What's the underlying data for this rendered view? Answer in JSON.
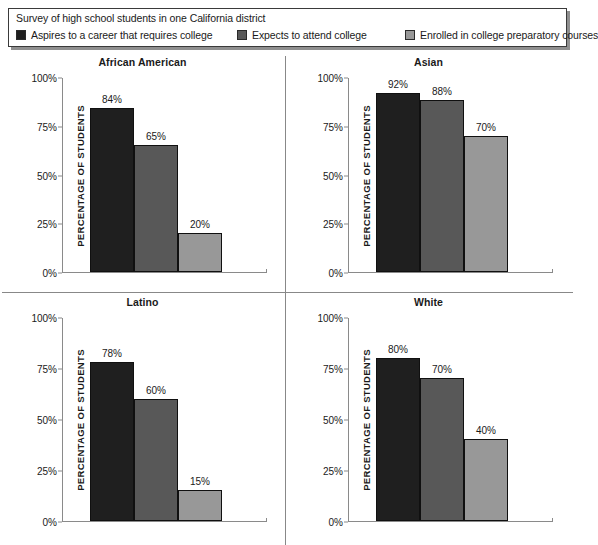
{
  "legend": {
    "caption": "Survey of high school students in one California district",
    "items": [
      {
        "label": "Aspires to a career that requires college",
        "color": "#1f1f1f",
        "icon": "legend-swatch-dark"
      },
      {
        "label": "Expects to attend college",
        "color": "#585858",
        "icon": "legend-swatch-medium"
      },
      {
        "label": "Enrolled in college preparatory courses",
        "color": "#989898",
        "icon": "legend-swatch-light"
      }
    ]
  },
  "axis": {
    "ylabel": "PERCENTAGE OF STUDENTS",
    "yticks": [
      "0%",
      "25%",
      "50%",
      "75%",
      "100%"
    ]
  },
  "chart_data": {
    "type": "bar",
    "title": "Survey of high school students in one California district",
    "xlabel": "",
    "ylabel": "PERCENTAGE OF STUDENTS",
    "ylim": [
      0,
      100
    ],
    "ytick_values": [
      0,
      25,
      50,
      75,
      100
    ],
    "ytick_labels": [
      "0%",
      "25%",
      "50%",
      "75%",
      "100%"
    ],
    "grid": false,
    "legend_position": "top",
    "layout": "2x2 small multiples",
    "categories": [
      "African American",
      "Asian",
      "Latino",
      "White"
    ],
    "series": [
      {
        "name": "Aspires to a career that requires college",
        "color": "#1f1f1f",
        "values": [
          84,
          92,
          78,
          80
        ],
        "labels": [
          "84%",
          "92%",
          "78%",
          "80%"
        ]
      },
      {
        "name": "Expects to attend college",
        "color": "#585858",
        "values": [
          65,
          88,
          60,
          70
        ],
        "labels": [
          "65%",
          "88%",
          "60%",
          "70%"
        ]
      },
      {
        "name": "Enrolled in college preparatory courses",
        "color": "#989898",
        "values": [
          70,
          70,
          15,
          40
        ],
        "labels": [
          "20%",
          "70%",
          "15%",
          "40%"
        ]
      }
    ],
    "panels": [
      {
        "title": "African American",
        "bars": [
          {
            "series": "Aspires to a career that requires college",
            "value": 84,
            "label": "84%",
            "color": "#1f1f1f"
          },
          {
            "series": "Expects to attend college",
            "value": 65,
            "label": "65%",
            "color": "#585858"
          },
          {
            "series": "Enrolled in college preparatory courses",
            "value": 20,
            "label": "20%",
            "color": "#989898"
          }
        ]
      },
      {
        "title": "Asian",
        "bars": [
          {
            "series": "Aspires to a career that requires college",
            "value": 92,
            "label": "92%",
            "color": "#1f1f1f"
          },
          {
            "series": "Expects to attend college",
            "value": 88,
            "label": "88%",
            "color": "#585858"
          },
          {
            "series": "Enrolled in college preparatory courses",
            "value": 70,
            "label": "70%",
            "color": "#989898"
          }
        ]
      },
      {
        "title": "Latino",
        "bars": [
          {
            "series": "Aspires to a career that requires college",
            "value": 78,
            "label": "78%",
            "color": "#1f1f1f"
          },
          {
            "series": "Expects to attend college",
            "value": 60,
            "label": "60%",
            "color": "#585858"
          },
          {
            "series": "Enrolled in college preparatory courses",
            "value": 15,
            "label": "15%",
            "color": "#989898"
          }
        ]
      },
      {
        "title": "White",
        "bars": [
          {
            "series": "Aspires to a career that requires college",
            "value": 80,
            "label": "80%",
            "color": "#1f1f1f"
          },
          {
            "series": "Expects to attend college",
            "value": 70,
            "label": "70%",
            "color": "#585858"
          },
          {
            "series": "Enrolled in college preparatory courses",
            "value": 40,
            "label": "40%",
            "color": "#989898"
          }
        ]
      }
    ]
  }
}
